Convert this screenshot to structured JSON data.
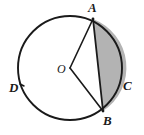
{
  "figure": {
    "kind": "circle-segment-diagram",
    "background_color": "#ffffff",
    "stroke_color": "#1a1a1a",
    "shaded_fill_color": "#b3b3b3",
    "labels": {
      "a": "A",
      "b": "B",
      "c": "C",
      "d": "D",
      "o": "O"
    }
  },
  "chart_data": {
    "type": "scatter",
    "title": "",
    "xlabel": "",
    "ylabel": "",
    "grid": false,
    "legend": null,
    "circle": {
      "center": {
        "x": 70,
        "y": 68
      },
      "radius": 52,
      "label": "O"
    },
    "points": [
      {
        "name": "A",
        "x": 93,
        "y": 19,
        "label": "A",
        "on_circle": true
      },
      {
        "name": "B",
        "x": 103,
        "y": 111,
        "label": "B",
        "on_circle": true
      },
      {
        "name": "C",
        "x": 121,
        "y": 85,
        "label": "C",
        "on_circle": true
      },
      {
        "name": "D",
        "x": 21,
        "y": 86,
        "label": "D",
        "on_circle": true
      },
      {
        "name": "O",
        "x": 70,
        "y": 68,
        "label": "O",
        "on_circle": false
      }
    ],
    "segments": [
      {
        "name": "OA",
        "from": "O",
        "to": "A",
        "kind": "radius"
      },
      {
        "name": "OB",
        "from": "O",
        "to": "B",
        "kind": "radius"
      },
      {
        "name": "AB",
        "from": "A",
        "to": "B",
        "kind": "chord"
      }
    ],
    "shaded_region": {
      "name": "segment-ACB",
      "bounded_by": [
        "chord AB",
        "arc A-C-B"
      ],
      "fill": "#b3b3b3"
    }
  }
}
